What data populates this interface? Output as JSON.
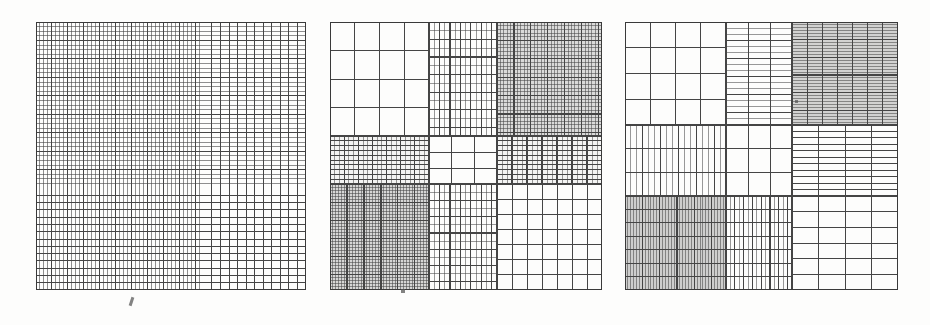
{
  "figure": {
    "title": "",
    "background_color": "#fdfdfc",
    "line_color": "#454545",
    "frame_color": "#3a3a3a",
    "panel_count": 3
  },
  "chart_data": {
    "type": "heatmap",
    "title": "",
    "subtitle": "",
    "xlabel": "",
    "ylabel": "",
    "legend": [],
    "grid": true,
    "panels": [
      {
        "name": "panel-1",
        "label": "(a)",
        "x": 36,
        "y": 22,
        "w": 270,
        "h": 268,
        "note": "Single full-square tensor grid: vertical lines crowd toward the left, horizontal lines crowd toward the top.",
        "layout": "single",
        "col_edges": [
          0.0,
          1.0
        ],
        "row_edges": [
          0.0,
          1.0
        ],
        "cells": [
          {
            "r": 0,
            "c": 0,
            "cols": 1,
            "rows": 1,
            "vlines": 52,
            "hlines": 48,
            "v_bias": 0.62,
            "h_bias": 0.62,
            "shade": 0.0,
            "density": "graded"
          }
        ]
      },
      {
        "name": "panel-2",
        "label": "(b)",
        "x": 330,
        "y": 22,
        "w": 272,
        "h": 268,
        "note": "3x3 block partition; refinement level varies per block, densest at top-right and bottom-left, coarsest in the centre.",
        "layout": "grid3x3",
        "col_edges": [
          0.0,
          0.365,
          0.613,
          1.0
        ],
        "row_edges": [
          0.0,
          0.425,
          0.605,
          1.0
        ],
        "cells": [
          {
            "r": 0,
            "c": 0,
            "vlines": 3,
            "hlines": 3,
            "shade": 0.0,
            "density": "coarse"
          },
          {
            "r": 0,
            "c": 1,
            "vlines": 12,
            "hlines": 12,
            "shade": 0.0,
            "density": "medium"
          },
          {
            "r": 0,
            "c": 2,
            "vlines": 30,
            "hlines": 30,
            "shade": 0.18,
            "density": "fine"
          },
          {
            "r": 1,
            "c": 0,
            "vlines": 20,
            "hlines": 9,
            "shade": 0.05,
            "density": "medium-fine"
          },
          {
            "r": 1,
            "c": 1,
            "vlines": 2,
            "hlines": 2,
            "shade": 0.0,
            "density": "coarsest"
          },
          {
            "r": 1,
            "c": 2,
            "vlines": 20,
            "hlines": 9,
            "shade": 0.05,
            "density": "medium-fine"
          },
          {
            "r": 2,
            "c": 0,
            "vlines": 34,
            "hlines": 34,
            "shade": 0.2,
            "density": "finest"
          },
          {
            "r": 2,
            "c": 1,
            "vlines": 12,
            "hlines": 12,
            "shade": 0.0,
            "density": "medium"
          },
          {
            "r": 2,
            "c": 2,
            "vlines": 6,
            "hlines": 6,
            "shade": 0.0,
            "density": "coarse"
          }
        ]
      },
      {
        "name": "panel-3",
        "label": "(c)",
        "x": 625,
        "y": 22,
        "w": 273,
        "h": 268,
        "note": "3x3 block partition with anisotropic refinement; some blocks are refined only in one direction, producing pure row or column stripes. Shaded blocks are refined in both directions.",
        "layout": "grid3x3",
        "col_edges": [
          0.0,
          0.37,
          0.612,
          1.0
        ],
        "row_edges": [
          0.0,
          0.385,
          0.65,
          1.0
        ],
        "cells": [
          {
            "r": 0,
            "c": 0,
            "vlines": 3,
            "hlines": 3,
            "shade": 0.0,
            "density": "coarse"
          },
          {
            "r": 0,
            "c": 1,
            "vlines": 2,
            "hlines": 16,
            "shade": 0.0,
            "density": "row-striped"
          },
          {
            "r": 0,
            "c": 2,
            "vlines": 6,
            "hlines": 34,
            "shade": 0.22,
            "density": "row-striped-fine"
          },
          {
            "r": 1,
            "c": 0,
            "vlines": 16,
            "hlines": 2,
            "shade": 0.0,
            "density": "column-striped"
          },
          {
            "r": 1,
            "c": 1,
            "vlines": 2,
            "hlines": 2,
            "shade": 0.0,
            "density": "coarsest"
          },
          {
            "r": 1,
            "c": 2,
            "vlines": 3,
            "hlines": 10,
            "shade": 0.0,
            "density": "row-striped"
          },
          {
            "r": 2,
            "c": 0,
            "vlines": 34,
            "hlines": 6,
            "shade": 0.24,
            "density": "column-striped-fine"
          },
          {
            "r": 2,
            "c": 1,
            "vlines": 14,
            "hlines": 6,
            "shade": 0.0,
            "density": "column-striped"
          },
          {
            "r": 2,
            "c": 2,
            "vlines": 3,
            "hlines": 5,
            "shade": 0.0,
            "density": "coarse"
          }
        ]
      }
    ],
    "artifacts": [
      {
        "name": "scan-speck-1",
        "x": 130,
        "y": 297,
        "w": 3,
        "h": 9,
        "rot": 18
      },
      {
        "name": "scan-speck-2",
        "x": 401,
        "y": 289,
        "w": 4,
        "h": 4,
        "rot": 0
      },
      {
        "name": "scan-speck-3",
        "x": 795,
        "y": 100,
        "w": 3,
        "h": 3,
        "rot": 0
      }
    ]
  }
}
